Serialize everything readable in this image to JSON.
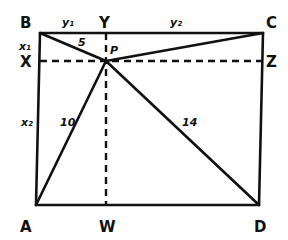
{
  "diagram": {
    "points": {
      "A": "A",
      "B": "B",
      "C": "C",
      "D": "D",
      "P": "P",
      "X": "X",
      "Y": "Y",
      "Z": "Z",
      "W": "W"
    },
    "segment_labels": {
      "BP": "5",
      "AP": "10",
      "DP": "14",
      "BY": "y₁",
      "YC": "y₂",
      "BX": "x₁",
      "XA": "x₂"
    },
    "colors": {
      "ink": "#111111",
      "background": "#ffffff"
    }
  }
}
